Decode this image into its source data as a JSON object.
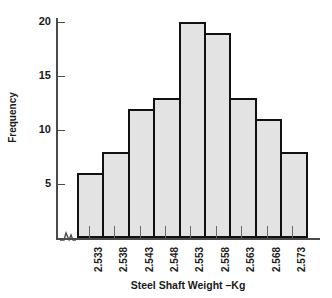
{
  "chart_data": {
    "type": "bar",
    "title": "",
    "xlabel": "Steel Shaft Weight –Kg",
    "ylabel": "Frequency",
    "categories": [
      "2.533",
      "2.538",
      "2.543",
      "2.548",
      "2.553",
      "2.558",
      "2.563",
      "2.568",
      "2.573"
    ],
    "values": [
      6,
      8,
      12,
      13,
      20,
      19,
      13,
      11,
      8
    ],
    "ylim": [
      0,
      21
    ],
    "yticks": [
      5,
      10,
      15,
      20
    ],
    "ytick_labels": [
      "5",
      "10",
      "15",
      "20"
    ],
    "grid": false,
    "legend": null
  },
  "axes": {
    "y_title": "Frequency",
    "x_title": "Steel Shaft Weight –Kg",
    "y_ticks": [
      {
        "label": "20",
        "value": 20
      },
      {
        "label": "15",
        "value": 15
      },
      {
        "label": "10",
        "value": 10
      },
      {
        "label": "5",
        "value": 5
      }
    ],
    "x_ticks": [
      {
        "label": "2.533",
        "value": 6
      },
      {
        "label": "2.538",
        "value": 8
      },
      {
        "label": "2.543",
        "value": 12
      },
      {
        "label": "2.548",
        "value": 13
      },
      {
        "label": "2.553",
        "value": 20
      },
      {
        "label": "2.558",
        "value": 19
      },
      {
        "label": "2.563",
        "value": 13
      },
      {
        "label": "2.568",
        "value": 11
      },
      {
        "label": "2.573",
        "value": 8
      }
    ]
  },
  "style": {
    "bar_fill": "#e3e3e3",
    "bar_stroke": "#111111",
    "axis_color": "#4a4a4a",
    "text_color": "#1a1a1a",
    "background": "#ffffff"
  }
}
